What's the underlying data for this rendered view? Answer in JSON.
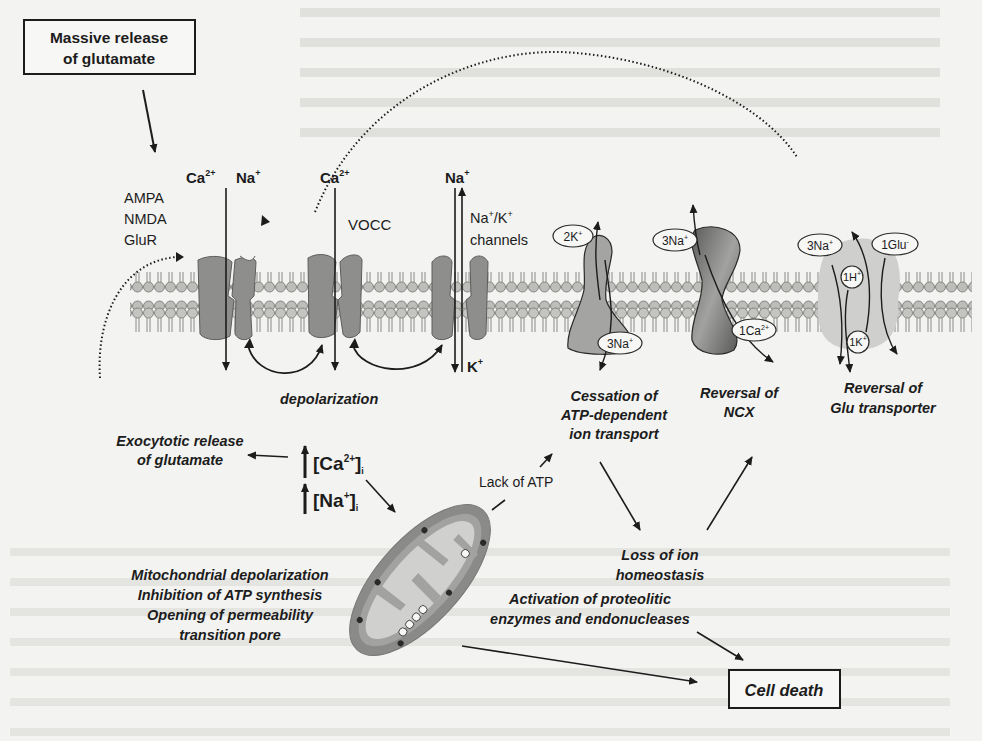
{
  "boxes": {
    "massive_release": [
      "Massive release",
      "of glutamate"
    ],
    "cell_death": "Cell death"
  },
  "receptors": {
    "glutamate_receptor": {
      "ions": [
        "Ca2+",
        "Na+"
      ],
      "names": [
        "AMPA",
        "NMDA",
        "GluR"
      ]
    },
    "vocc": {
      "ion": "Ca2+",
      "name": "VOCC"
    },
    "na_k_channels": {
      "ions_in": "Na+",
      "ions_out": "K+",
      "name": [
        "Na+/K+",
        "channels"
      ]
    }
  },
  "transporters": {
    "na_k_atpase": {
      "ions": [
        "2K+",
        "3Na+"
      ],
      "label": [
        "Cessation of",
        "ATP-dependent",
        "ion transport"
      ]
    },
    "ncx": {
      "ions": [
        "3Na+",
        "1Ca2+"
      ],
      "label": [
        "Reversal of",
        "NCX"
      ]
    },
    "glu_transporter": {
      "ions": [
        "3Na+",
        "1Glu-",
        "1H+",
        "1K+"
      ],
      "label": [
        "Reversal of",
        "Glu transporter"
      ]
    }
  },
  "processes": {
    "depolarization": "depolarization",
    "exocytotic": [
      "Exocytotic release",
      "of glutamate"
    ],
    "ca_i": "[Ca2+]i",
    "na_i": "[Na+]i",
    "lack_atp": "Lack of ATP",
    "mito": [
      "Mitochondrial depolarization",
      "Inhibition of ATP synthesis",
      "Opening of permeability",
      "transition pore"
    ],
    "loss_homeostasis": [
      "Loss of ion",
      "homeostasis"
    ],
    "activation": [
      "Activation of proteolitic",
      "enzymes and endonucleases"
    ]
  },
  "colors": {
    "membrane_head": "#b9b9b6",
    "protein": "#8e8e8c",
    "ncx_dark": "#6a6a68",
    "mito_outer": "#8a8a88",
    "mito_inner": "#d0d0ce"
  }
}
